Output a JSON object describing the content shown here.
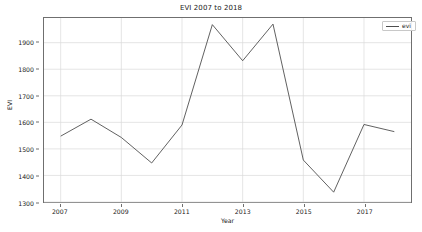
{
  "chart_data": {
    "type": "line",
    "title": "EVI 2007 to 2018",
    "xlabel": "Year",
    "ylabel": "EVI",
    "x": [
      2007,
      2008,
      2009,
      2010,
      2011,
      2012,
      2013,
      2014,
      2015,
      2016,
      2017,
      2018
    ],
    "xtick_labels": [
      "2007",
      "2009",
      "2011",
      "2013",
      "2015",
      "2017"
    ],
    "xticks": [
      2007,
      2009,
      2011,
      2013,
      2015,
      2017
    ],
    "ytick_labels": [
      "1300",
      "1400",
      "1500",
      "1600",
      "1700",
      "1800",
      "1900"
    ],
    "yticks": [
      1300,
      1400,
      1500,
      1600,
      1700,
      1800,
      1900
    ],
    "xlim": [
      2006.45,
      2018.55
    ],
    "ylim": [
      1300,
      1993
    ],
    "grid": true,
    "legend_position": "upper right",
    "series": [
      {
        "name": "evi",
        "color": "#4d4d4d",
        "values": [
          1548,
          1612,
          1543,
          1447,
          1590,
          1968,
          1832,
          1970,
          1458,
          1337,
          1592,
          1565
        ]
      }
    ]
  },
  "legend": {
    "entries": [
      {
        "label": "evi"
      }
    ]
  }
}
